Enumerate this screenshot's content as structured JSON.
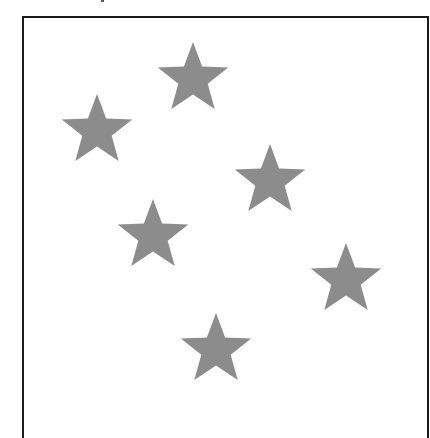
{
  "figure": {
    "star_count": 6,
    "star_color": "#8c8c8c",
    "border_color": "#1a1a1a",
    "background_color": "#ffffff"
  },
  "stars": [
    {
      "id": "star-1",
      "shape": "five-pointed-star"
    },
    {
      "id": "star-2",
      "shape": "five-pointed-star"
    },
    {
      "id": "star-3",
      "shape": "five-pointed-star"
    },
    {
      "id": "star-4",
      "shape": "five-pointed-star"
    },
    {
      "id": "star-5",
      "shape": "five-pointed-star"
    },
    {
      "id": "star-6",
      "shape": "five-pointed-star"
    }
  ]
}
